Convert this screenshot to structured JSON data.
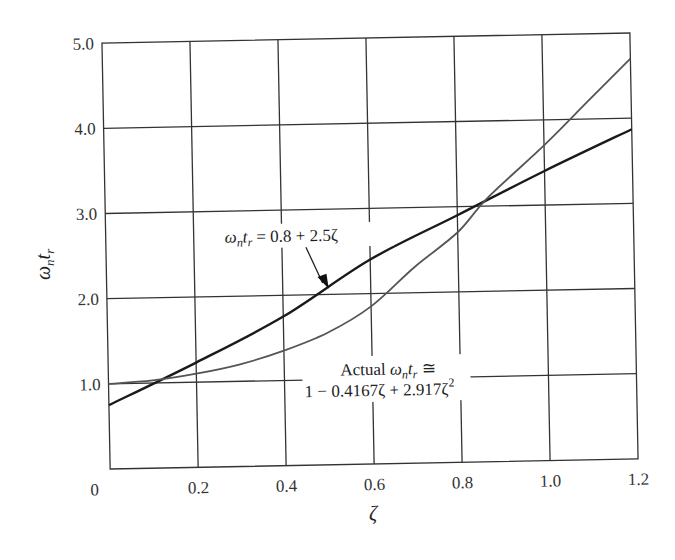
{
  "chart_data": {
    "type": "line",
    "title": "",
    "xlabel": "ζ",
    "ylabel": "ωntr",
    "xlim": [
      0,
      1.2
    ],
    "ylim": [
      0,
      5.0
    ],
    "grid": true,
    "x_ticks": [
      "0",
      "0.2",
      "0.4",
      "0.6",
      "0.8",
      "1.0",
      "1.2"
    ],
    "y_ticks": [
      "1.0",
      "2.0",
      "3.0",
      "4.0",
      "5.0"
    ],
    "series": [
      {
        "name": "ωntr = 0.8 + 2.5ζ",
        "color": "#1a1a1a",
        "x": [
          0,
          0.2,
          0.4,
          0.6,
          0.8,
          1.0,
          1.2
        ],
        "values": [
          0.75,
          1.23,
          1.75,
          2.4,
          2.9,
          3.4,
          3.87
        ]
      },
      {
        "name": "Actual ωntr ≅ 1 − 0.4167ζ + 2.917ζ²",
        "color": "#555555",
        "x": [
          0,
          0.1,
          0.2,
          0.3,
          0.4,
          0.5,
          0.6,
          0.7,
          0.8,
          0.87,
          1.0,
          1.1,
          1.2
        ],
        "values": [
          1.0,
          1.03,
          1.1,
          1.2,
          1.35,
          1.55,
          1.85,
          2.3,
          2.7,
          3.1,
          3.7,
          4.2,
          4.7
        ]
      }
    ],
    "annotations": [
      {
        "text_main": "ωntr = 0.8 + 2.5ζ",
        "points_to": [
          0.5,
          2.05
        ]
      },
      {
        "line1": "Actual ωntr ≅",
        "line2": "1 − 0.4167ζ + 2.917ζ²",
        "position": [
          0.7,
          0.95
        ]
      }
    ]
  },
  "labels": {
    "x_axis": "ζ",
    "y_axis_main": "ω",
    "y_axis_sub1": "n",
    "y_axis_mid": "t",
    "y_axis_sub2": "r",
    "x0": "0",
    "ann1_omega": "ω",
    "ann1_n": "n",
    "ann1_t": "t",
    "ann1_r": "r",
    "ann1_rest": " = 0.8 + 2.5ζ",
    "ann2_prefix": "Actual ",
    "ann2_omega": "ω",
    "ann2_n": "n",
    "ann2_t": "t",
    "ann2_r": "r",
    "ann2_approx": " ≅",
    "ann2_line2": "1 − 0.4167ζ + 2.917ζ",
    "ann2_sup": "2"
  }
}
